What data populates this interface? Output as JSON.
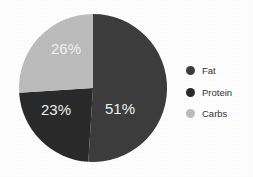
{
  "chart_data": {
    "type": "pie",
    "title": "",
    "subtitle": "",
    "xlabel": "",
    "ylabel": "",
    "grid": false,
    "legend_position": "right",
    "categories": [
      "Fat",
      "Protein",
      "Carbs"
    ],
    "values": [
      51,
      23,
      26
    ],
    "value_unit": "%",
    "slices": [
      {
        "label": "Fat",
        "value": 51,
        "data_label": "51%",
        "color": "#3d3d3d"
      },
      {
        "label": "Protein",
        "value": 23,
        "data_label": "23%",
        "color": "#2a2a2a"
      },
      {
        "label": "Carbs",
        "value": 26,
        "data_label": "26%",
        "color": "#bdbdbd"
      }
    ],
    "start_angle_deg": 0,
    "direction": "clockwise",
    "data_label_color": "#f2f2f2",
    "background_color": "#ffffff"
  },
  "legend": {
    "items": [
      {
        "label": "Fat",
        "color": "#3d3d3d"
      },
      {
        "label": "Protein",
        "color": "#2a2a2a"
      },
      {
        "label": "Carbs",
        "color": "#bdbdbd"
      }
    ]
  },
  "geometry": {
    "center_x": 93,
    "center_y": 88,
    "radius": 74,
    "label_positions": [
      {
        "label": "51%",
        "x": 120,
        "y": 110
      },
      {
        "label": "23%",
        "x": 56,
        "y": 111
      },
      {
        "label": "26%",
        "x": 66,
        "y": 50
      }
    ]
  }
}
